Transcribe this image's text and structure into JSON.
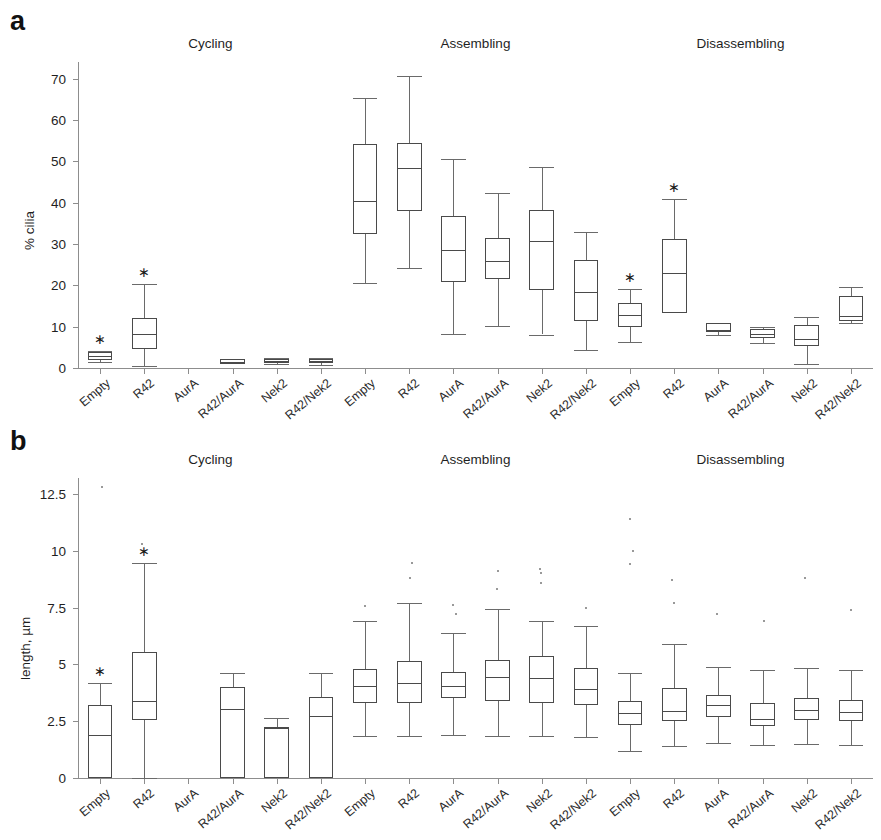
{
  "figure": {
    "panels": [
      {
        "letter": "a",
        "ylabel": "% cilia",
        "yticks": [
          "0",
          "10",
          "20",
          "30",
          "40",
          "50",
          "60",
          "70"
        ],
        "ylim": [
          0,
          74
        ],
        "group_titles": [
          "Cycling",
          "Assembling",
          "Disassembling"
        ],
        "categories": [
          "Empty",
          "R42",
          "AurA",
          "R42/AurA",
          "Nek2",
          "R42/Nek2",
          "Empty",
          "R42",
          "AurA",
          "R42/AurA",
          "Nek2",
          "R42/Nek2",
          "Empty",
          "R42",
          "AurA",
          "R42/AurA",
          "Nek2",
          "R42/Nek2"
        ]
      },
      {
        "letter": "b",
        "ylabel": "length, µm",
        "yticks": [
          "0",
          "2.5",
          "5",
          "7.5",
          "10",
          "12.5"
        ],
        "ylim": [
          0,
          13.2
        ],
        "group_titles": [
          "Cycling",
          "Assembling",
          "Disassembling"
        ],
        "categories": [
          "Empty",
          "R42",
          "AurA",
          "R42/AurA",
          "Nek2",
          "R42/Nek2",
          "Empty",
          "R42",
          "AurA",
          "R42/AurA",
          "Nek2",
          "R42/Nek2",
          "Empty",
          "R42",
          "AurA",
          "R42/AurA",
          "Nek2",
          "R42/Nek2"
        ]
      }
    ]
  },
  "chart_data": [
    {
      "type": "box",
      "panel": "a",
      "title": "",
      "xlabel": "",
      "ylabel": "% cilia",
      "ylim": [
        0,
        74
      ],
      "yticks": [
        0,
        10,
        20,
        30,
        40,
        50,
        60,
        70
      ],
      "grid": false,
      "legend": "none",
      "groups": [
        "Cycling",
        "Assembling",
        "Disassembling"
      ],
      "categories": [
        "Empty",
        "R42",
        "AurA",
        "R42/AurA",
        "Nek2",
        "R42/Nek2",
        "Empty",
        "R42",
        "AurA",
        "R42/AurA",
        "Nek2",
        "R42/Nek2",
        "Empty",
        "R42",
        "AurA",
        "R42/AurA",
        "Nek2",
        "R42/Nek2"
      ],
      "boxes": [
        {
          "group": "Cycling",
          "category": "Empty",
          "whisker_low": 1.4,
          "q1": 2.0,
          "median": 3.0,
          "q3": 3.9,
          "whisker_high": 4.2,
          "significant": true,
          "outliers": [
            7.0
          ]
        },
        {
          "group": "Cycling",
          "category": "R42",
          "whisker_low": 0.4,
          "q1": 4.5,
          "median": 8.2,
          "q3": 12.2,
          "whisker_high": 20.2,
          "significant": true,
          "outliers": []
        },
        {
          "group": "Cycling",
          "category": "AurA",
          "whisker_low": 0.0,
          "q1": 0.0,
          "median": 0.0,
          "q3": 0.0,
          "whisker_high": 0.0,
          "significant": false,
          "outliers": []
        },
        {
          "group": "Cycling",
          "category": "R42/AurA",
          "whisker_low": 0.9,
          "q1": 0.9,
          "median": 1.5,
          "q3": 2.2,
          "whisker_high": 2.2,
          "significant": false,
          "outliers": []
        },
        {
          "group": "Cycling",
          "category": "Nek2",
          "whisker_low": 1.0,
          "q1": 1.2,
          "median": 1.8,
          "q3": 2.2,
          "whisker_high": 2.4,
          "significant": false,
          "outliers": []
        },
        {
          "group": "Cycling",
          "category": "R42/Nek2",
          "whisker_low": 0.8,
          "q1": 1.1,
          "median": 1.6,
          "q3": 2.1,
          "whisker_high": 2.4,
          "significant": false,
          "outliers": []
        },
        {
          "group": "Assembling",
          "category": "Empty",
          "whisker_low": 20.5,
          "q1": 32.3,
          "median": 40.5,
          "q3": 54.2,
          "whisker_high": 65.3,
          "significant": false,
          "outliers": []
        },
        {
          "group": "Assembling",
          "category": "R42",
          "whisker_low": 24.3,
          "q1": 37.9,
          "median": 48.4,
          "q3": 54.3,
          "whisker_high": 70.5,
          "significant": false,
          "outliers": []
        },
        {
          "group": "Assembling",
          "category": "AurA",
          "whisker_low": 8.2,
          "q1": 20.8,
          "median": 28.6,
          "q3": 36.8,
          "whisker_high": 50.5,
          "significant": false,
          "outliers": []
        },
        {
          "group": "Assembling",
          "category": "R42/AurA",
          "whisker_low": 10.2,
          "q1": 21.5,
          "median": 25.9,
          "q3": 31.5,
          "whisker_high": 42.2,
          "significant": false,
          "outliers": []
        },
        {
          "group": "Assembling",
          "category": "Nek2",
          "whisker_low": 8.1,
          "q1": 18.8,
          "median": 30.6,
          "q3": 38.2,
          "whisker_high": 48.6,
          "significant": false,
          "outliers": []
        },
        {
          "group": "Assembling",
          "category": "R42/Nek2",
          "whisker_low": 4.4,
          "q1": 11.3,
          "median": 18.4,
          "q3": 26.1,
          "whisker_high": 33.0,
          "significant": false,
          "outliers": []
        },
        {
          "group": "Disassembling",
          "category": "Empty",
          "whisker_low": 6.4,
          "q1": 10.0,
          "median": 12.8,
          "q3": 15.8,
          "whisker_high": 19.0,
          "significant": true,
          "outliers": []
        },
        {
          "group": "Disassembling",
          "category": "R42",
          "whisker_low": 13.4,
          "q1": 13.4,
          "median": 23.0,
          "q3": 31.2,
          "whisker_high": 40.8,
          "significant": true,
          "outliers": []
        },
        {
          "group": "Disassembling",
          "category": "AurA",
          "whisker_low": 8.1,
          "q1": 8.6,
          "median": 9.2,
          "q3": 10.8,
          "whisker_high": 10.8,
          "significant": false,
          "outliers": []
        },
        {
          "group": "Disassembling",
          "category": "R42/AurA",
          "whisker_low": 6.0,
          "q1": 7.3,
          "median": 8.3,
          "q3": 9.5,
          "whisker_high": 9.9,
          "significant": false,
          "outliers": []
        },
        {
          "group": "Disassembling",
          "category": "Nek2",
          "whisker_low": 1.0,
          "q1": 5.4,
          "median": 7.0,
          "q3": 10.4,
          "whisker_high": 12.4,
          "significant": false,
          "outliers": []
        },
        {
          "group": "Disassembling",
          "category": "R42/Nek2",
          "whisker_low": 11.0,
          "q1": 11.4,
          "median": 12.5,
          "q3": 17.4,
          "whisker_high": 19.6,
          "significant": false,
          "outliers": []
        }
      ]
    },
    {
      "type": "box",
      "panel": "b",
      "title": "",
      "xlabel": "",
      "ylabel": "length, µm",
      "ylim": [
        0,
        13.2
      ],
      "yticks": [
        0,
        2.5,
        5,
        7.5,
        10,
        12.5
      ],
      "grid": false,
      "legend": "none",
      "groups": [
        "Cycling",
        "Assembling",
        "Disassembling"
      ],
      "categories": [
        "Empty",
        "R42",
        "AurA",
        "R42/AurA",
        "Nek2",
        "R42/Nek2",
        "Empty",
        "R42",
        "AurA",
        "R42/AurA",
        "Nek2",
        "R42/Nek2",
        "Empty",
        "R42",
        "AurA",
        "R42/AurA",
        "Nek2",
        "R42/Nek2"
      ],
      "boxes": [
        {
          "group": "Cycling",
          "category": "Empty",
          "whisker_low": 0.0,
          "q1": 0.0,
          "median": 1.9,
          "q3": 3.2,
          "whisker_high": 4.2,
          "significant": true,
          "outliers": [
            12.8
          ]
        },
        {
          "group": "Cycling",
          "category": "R42",
          "whisker_low": 0.0,
          "q1": 2.55,
          "median": 3.4,
          "q3": 5.55,
          "whisker_high": 9.45,
          "significant": true,
          "outliers": [
            10.3
          ]
        },
        {
          "group": "Cycling",
          "category": "AurA",
          "whisker_low": 0.0,
          "q1": 0.0,
          "median": 0.0,
          "q3": 0.0,
          "whisker_high": 0.0,
          "significant": false,
          "outliers": []
        },
        {
          "group": "Cycling",
          "category": "R42/AurA",
          "whisker_low": 0.0,
          "q1": 0.0,
          "median": 3.05,
          "q3": 4.0,
          "whisker_high": 4.6,
          "significant": false,
          "outliers": []
        },
        {
          "group": "Cycling",
          "category": "Nek2",
          "whisker_low": 0.0,
          "q1": 0.0,
          "median": 2.2,
          "q3": 2.25,
          "whisker_high": 2.65,
          "significant": false,
          "outliers": []
        },
        {
          "group": "Cycling",
          "category": "R42/Nek2",
          "whisker_low": 0.0,
          "q1": 0.0,
          "median": 2.75,
          "q3": 3.55,
          "whisker_high": 4.6,
          "significant": false,
          "outliers": []
        },
        {
          "group": "Assembling",
          "category": "Empty",
          "whisker_low": 1.85,
          "q1": 3.3,
          "median": 4.05,
          "q3": 4.8,
          "whisker_high": 6.9,
          "significant": false,
          "outliers": [
            7.55
          ]
        },
        {
          "group": "Assembling",
          "category": "R42",
          "whisker_low": 1.85,
          "q1": 3.3,
          "median": 4.2,
          "q3": 5.15,
          "whisker_high": 7.7,
          "significant": false,
          "outliers": [
            8.8,
            9.45
          ]
        },
        {
          "group": "Assembling",
          "category": "AurA",
          "whisker_low": 1.9,
          "q1": 3.5,
          "median": 4.05,
          "q3": 4.65,
          "whisker_high": 6.4,
          "significant": false,
          "outliers": [
            7.2,
            7.6
          ]
        },
        {
          "group": "Assembling",
          "category": "R42/AurA",
          "whisker_low": 1.85,
          "q1": 3.4,
          "median": 4.45,
          "q3": 5.2,
          "whisker_high": 7.45,
          "significant": false,
          "outliers": [
            8.3,
            9.1
          ]
        },
        {
          "group": "Assembling",
          "category": "Nek2",
          "whisker_low": 1.85,
          "q1": 3.3,
          "median": 4.4,
          "q3": 5.35,
          "whisker_high": 6.9,
          "significant": false,
          "outliers": [
            8.6,
            9.2,
            9.0
          ]
        },
        {
          "group": "Assembling",
          "category": "R42/Nek2",
          "whisker_low": 1.8,
          "q1": 3.2,
          "median": 3.9,
          "q3": 4.85,
          "whisker_high": 6.7,
          "significant": false,
          "outliers": [
            7.5
          ]
        },
        {
          "group": "Disassembling",
          "category": "Empty",
          "whisker_low": 1.2,
          "q1": 2.35,
          "median": 2.85,
          "q3": 3.4,
          "whisker_high": 4.6,
          "significant": false,
          "outliers": [
            9.4,
            10.0,
            11.4
          ]
        },
        {
          "group": "Disassembling",
          "category": "R42",
          "whisker_low": 1.4,
          "q1": 2.5,
          "median": 2.95,
          "q3": 3.95,
          "whisker_high": 5.9,
          "significant": false,
          "outliers": [
            7.7,
            8.7
          ]
        },
        {
          "group": "Disassembling",
          "category": "AurA",
          "whisker_low": 1.55,
          "q1": 2.7,
          "median": 3.2,
          "q3": 3.65,
          "whisker_high": 4.9,
          "significant": false,
          "outliers": [
            7.2
          ]
        },
        {
          "group": "Disassembling",
          "category": "R42/AurA",
          "whisker_low": 1.45,
          "q1": 2.3,
          "median": 2.6,
          "q3": 3.3,
          "whisker_high": 4.75,
          "significant": false,
          "outliers": [
            6.9
          ]
        },
        {
          "group": "Disassembling",
          "category": "Nek2",
          "whisker_low": 1.5,
          "q1": 2.55,
          "median": 3.0,
          "q3": 3.5,
          "whisker_high": 4.85,
          "significant": false,
          "outliers": [
            8.8
          ]
        },
        {
          "group": "Disassembling",
          "category": "R42/Nek2",
          "whisker_low": 1.45,
          "q1": 2.5,
          "median": 2.9,
          "q3": 3.45,
          "whisker_high": 4.75,
          "significant": false,
          "outliers": [
            7.4
          ]
        }
      ]
    }
  ],
  "colors": {
    "box_stroke": "#4a4a4a",
    "whisker_stroke": "#6a6a6a",
    "axis": "#8d8d8d",
    "text": "#1f1f1f",
    "background": "#ffffff"
  }
}
